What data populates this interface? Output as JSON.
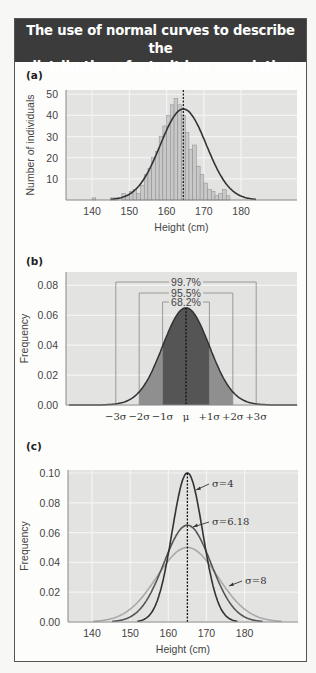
{
  "header": {
    "title_line1": "The use of normal curves to describe the",
    "title_line2": "distribution of a trait in a population"
  },
  "colors": {
    "header_bg": "#3b3b3b",
    "plot_bg": "#e3e3e2",
    "grid": "#f4f4f4",
    "bar_fill": "#c8c8c8",
    "bar_stroke": "#8a8a8a",
    "curve": "#333333",
    "sigma1_fill": "#555555",
    "sigma2_fill": "#8f8f8f",
    "sigma3_fill": "#b4b4b4",
    "sigma4_curve": "#333333",
    "sigma618_curve": "#555555",
    "sigma8_curve": "#a9a9a9"
  },
  "chart_data": [
    {
      "panel": "(a)",
      "type": "bar",
      "title": "",
      "xlabel": "Height (cm)",
      "ylabel": "Number of individuals",
      "x_ticks": [
        140,
        150,
        160,
        170,
        180
      ],
      "y_ticks": [
        10,
        20,
        30,
        40,
        50
      ],
      "xlim": [
        133,
        195
      ],
      "ylim": [
        0,
        52
      ],
      "grid": true,
      "mean_line": 164.5,
      "fitted_curve": {
        "type": "normal",
        "mean": 164.5,
        "sd": 6.18,
        "peak": 43
      },
      "bins_start": 140,
      "bin_width": 1,
      "values": [
        1,
        0,
        0,
        0,
        0,
        1,
        1,
        0,
        3,
        2,
        4,
        5,
        3,
        7,
        12,
        15,
        20,
        23,
        30,
        35,
        40,
        45,
        48,
        45,
        40,
        32,
        24,
        26,
        16,
        12,
        8,
        5,
        4,
        2,
        3,
        5,
        2,
        0,
        0
      ]
    },
    {
      "panel": "(b)",
      "type": "area",
      "title": "",
      "xlabel": "",
      "ylabel": "Frequency",
      "x_ticks": [
        "−3σ",
        "−2σ",
        "−1σ",
        "μ",
        "+1σ",
        "+2σ",
        "+3σ"
      ],
      "y_ticks": [
        0.0,
        0.02,
        0.04,
        0.06,
        0.08
      ],
      "ylim": [
        0,
        0.089
      ],
      "grid": true,
      "curve": {
        "type": "normal",
        "mean": 0,
        "sd": 1,
        "peak": 0.065
      },
      "intervals": [
        {
          "label": "68.2%",
          "range_sigma": [
            -1,
            1
          ]
        },
        {
          "label": "95.5%",
          "range_sigma": [
            -2,
            2
          ]
        },
        {
          "label": "99.7%",
          "range_sigma": [
            -3,
            3
          ]
        }
      ]
    },
    {
      "panel": "(c)",
      "type": "line",
      "title": "",
      "xlabel": "Height (cm)",
      "ylabel": "Frequency",
      "x_ticks": [
        140,
        150,
        160,
        170,
        180
      ],
      "y_ticks": [
        0.0,
        0.02,
        0.04,
        0.06,
        0.08,
        0.1
      ],
      "xlim": [
        133.7,
        194
      ],
      "ylim": [
        0,
        0.102
      ],
      "grid": true,
      "mean_line": 165,
      "series": [
        {
          "name": "σ=4",
          "mean": 165,
          "sd": 4,
          "peak": 0.1
        },
        {
          "name": "σ=6.18",
          "mean": 165,
          "sd": 6.18,
          "peak": 0.065
        },
        {
          "name": "σ=8",
          "mean": 165,
          "sd": 8,
          "peak": 0.05
        }
      ]
    }
  ],
  "labels": {
    "panel_a": "(a)",
    "panel_b": "(b)",
    "panel_c": "(c)"
  }
}
